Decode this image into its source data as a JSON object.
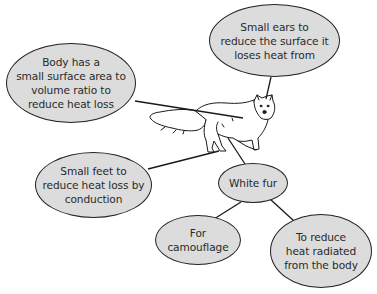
{
  "diagram": {
    "central_image": "arctic-fox-drawing",
    "colors": {
      "bubble_fill": "#dcdcdc",
      "bubble_stroke": "#222222",
      "text": "#2a2a2a",
      "background": "#ffffff"
    },
    "bubbles": {
      "body": {
        "label": "Body has a\nsmall surface area to\nvolume ratio to\nreduce heat loss",
        "connects_to": "fox-body"
      },
      "ears": {
        "label": "Small ears to\nreduce the surface it\nloses heat from",
        "connects_to": "fox-ears"
      },
      "feet": {
        "label": "Small feet to\nreduce heat loss by\nconduction",
        "connects_to": "fox-feet"
      },
      "fur": {
        "label": "White fur",
        "connects_to": "fox-body"
      },
      "camouflage": {
        "label": "For\ncamouflage",
        "connects_to": "white-fur"
      },
      "radiated": {
        "label": "To reduce\nheat radiated\nfrom the body",
        "connects_to": "white-fur"
      }
    }
  }
}
